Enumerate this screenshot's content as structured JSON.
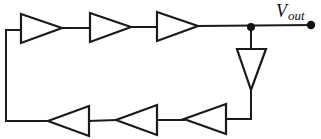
{
  "diagram": {
    "colors": {
      "stroke": "#1a1a1a",
      "background": "#ffffff"
    },
    "output_label": {
      "main": "V",
      "sub": "out"
    },
    "inverters": [
      {
        "id": "inv1",
        "direction": "right",
        "row": "top"
      },
      {
        "id": "inv2",
        "direction": "right",
        "row": "top"
      },
      {
        "id": "inv3",
        "direction": "right",
        "row": "top"
      },
      {
        "id": "buf4",
        "direction": "down",
        "row": "right"
      },
      {
        "id": "inv5",
        "direction": "left",
        "row": "bottom"
      },
      {
        "id": "inv6",
        "direction": "left",
        "row": "bottom"
      },
      {
        "id": "inv7",
        "direction": "left",
        "row": "bottom"
      }
    ],
    "nodes": [
      {
        "id": "junction",
        "type": "dot"
      },
      {
        "id": "vout-terminal",
        "type": "dot"
      }
    ]
  }
}
